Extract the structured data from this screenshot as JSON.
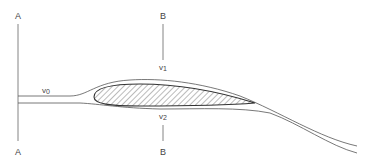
{
  "diagram": {
    "type": "airfoil-streamline",
    "sections": [
      {
        "id": "A",
        "top_label": "A",
        "bottom_label": "A"
      },
      {
        "id": "B",
        "top_label": "B",
        "bottom_label": "B"
      }
    ],
    "velocities": {
      "v0": {
        "symbol": "v",
        "subscript": "0"
      },
      "v1": {
        "symbol": "v",
        "subscript": "1"
      },
      "v2": {
        "symbol": "v",
        "subscript": "2"
      }
    },
    "colors": {
      "line": "#555555",
      "fill": "#ffffff",
      "hatch": "#444444"
    }
  }
}
